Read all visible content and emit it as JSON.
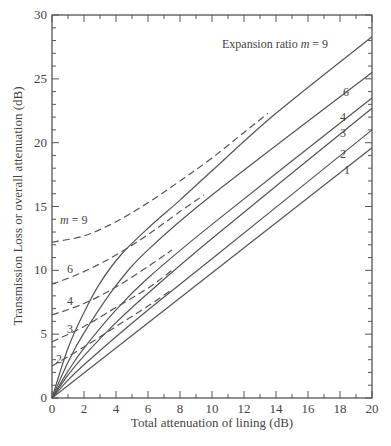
{
  "chart_data": {
    "type": "line",
    "title": "",
    "xlabel": "Total attenuation of lining (dB)",
    "ylabel": "Transmission Loss or overall attenuation (dB)",
    "xlim": [
      0,
      20
    ],
    "ylim": [
      0,
      30
    ],
    "x_ticks": [
      0,
      2,
      4,
      6,
      8,
      10,
      12,
      14,
      16,
      18,
      20
    ],
    "y_ticks": [
      0,
      5,
      10,
      15,
      20,
      25,
      30
    ],
    "grid": false,
    "legend": "none (curves labelled directly)",
    "annotation": "Expansion ratio m = 9",
    "series": [
      {
        "name": "m = 1",
        "style": "solid",
        "x": [
          0,
          20
        ],
        "y": [
          0,
          19.6
        ]
      },
      {
        "name": "m = 2",
        "style": "solid",
        "x": [
          0,
          1,
          2,
          4,
          6,
          10,
          20
        ],
        "y": [
          0,
          1.4,
          2.6,
          4.8,
          6.9,
          10.9,
          21.0
        ]
      },
      {
        "name": "m = 3",
        "style": "solid",
        "x": [
          0,
          1,
          2,
          4,
          6,
          10,
          20
        ],
        "y": [
          0,
          1.8,
          3.3,
          5.9,
          8.2,
          12.5,
          22.7
        ]
      },
      {
        "name": "m = 4",
        "style": "solid",
        "x": [
          0,
          1,
          2,
          4,
          6,
          10,
          20
        ],
        "y": [
          0,
          2.1,
          3.9,
          6.9,
          9.4,
          13.6,
          23.5
        ]
      },
      {
        "name": "m = 6",
        "style": "solid",
        "x": [
          0,
          1,
          2,
          4,
          6,
          10,
          20
        ],
        "y": [
          0,
          2.8,
          5.1,
          8.8,
          11.6,
          15.9,
          25.5
        ]
      },
      {
        "name": "m = 9",
        "style": "solid",
        "x": [
          0,
          1,
          2,
          3,
          4.3,
          6,
          8,
          10,
          14,
          20
        ],
        "y": [
          0,
          3.9,
          6.7,
          9.0,
          11.2,
          13.3,
          15.5,
          17.8,
          22.3,
          28.3
        ]
      },
      {
        "name": "m = 9 (dashed)",
        "style": "dashed",
        "x": [
          0,
          2,
          4,
          6,
          8,
          10,
          12,
          13.5
        ],
        "y": [
          12.2,
          12.7,
          13.8,
          15.3,
          17.0,
          18.8,
          20.8,
          22.3
        ]
      },
      {
        "name": "m = 6 (dashed)",
        "style": "dashed",
        "x": [
          0,
          2,
          4,
          6,
          8,
          9.5
        ],
        "y": [
          8.9,
          9.9,
          11.2,
          12.8,
          14.6,
          15.9
        ]
      },
      {
        "name": "m = 4 (dashed)",
        "style": "dashed",
        "x": [
          0,
          2,
          4,
          6,
          7.5
        ],
        "y": [
          6.5,
          7.4,
          8.7,
          10.3,
          11.6
        ]
      },
      {
        "name": "m = 3 (dashed)",
        "style": "dashed",
        "x": [
          0,
          2,
          4,
          6,
          7.5
        ],
        "y": [
          4.4,
          5.6,
          7.1,
          8.6,
          10.0
        ]
      },
      {
        "name": "m = 2 (dashed)",
        "style": "dashed",
        "x": [
          0,
          2,
          4,
          6,
          7.5
        ],
        "y": [
          2.5,
          4.0,
          5.6,
          7.2,
          8.5
        ]
      }
    ],
    "curve_labels": {
      "right": [
        "Expansion ratio m = 9",
        "6",
        "4",
        "3",
        "2",
        "1"
      ],
      "left": [
        "m = 9",
        "6",
        "4",
        "3",
        "2"
      ]
    }
  },
  "labels": {
    "xlabel": "Total attenuation of lining (dB)",
    "ylabel": "Transmission Loss or overall attenuation (dB)",
    "annotation_prefix": "Expansion ratio ",
    "annotation_m": "m",
    "annotation_suffix": " = 9",
    "right_6": "6",
    "right_4": "4",
    "right_3": "3",
    "right_2": "2",
    "right_1": "1",
    "left_m": "m",
    "left_9": " = 9",
    "left_6": "6",
    "left_4": "4",
    "left_3": "3",
    "left_2": "2"
  }
}
